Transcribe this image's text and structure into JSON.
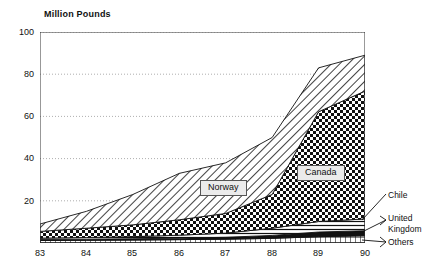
{
  "chart_data": {
    "type": "area",
    "stacked": true,
    "title": "Million Pounds",
    "ylabel": "Million Pounds",
    "xlabel": "",
    "x": [
      "83",
      "84",
      "85",
      "86",
      "87",
      "88",
      "89",
      "90"
    ],
    "categories": [
      "83",
      "84",
      "85",
      "86",
      "87",
      "88",
      "89",
      "90"
    ],
    "ylim": [
      0,
      100
    ],
    "yticks": [
      0,
      20,
      40,
      60,
      80,
      100
    ],
    "ytick_labels": [
      "0",
      "20",
      "40",
      "60",
      "80",
      "100"
    ],
    "grid": "horizontal-dotted",
    "legend_position": "right-outside-and-inline",
    "series": [
      {
        "name": "Others",
        "pattern": "fine-grid",
        "values": [
          1.2,
          1.3,
          1.4,
          1.6,
          1.8,
          2.2,
          3.0,
          3.4
        ]
      },
      {
        "name": "United Kingdom",
        "pattern": "solid-black",
        "values": [
          0.5,
          0.5,
          0.6,
          0.7,
          0.9,
          1.4,
          2.2,
          2.4
        ]
      },
      {
        "name": "Chile",
        "pattern": "horizontal-lines",
        "values": [
          0.6,
          0.8,
          1.0,
          1.4,
          2.0,
          3.4,
          5.0,
          5.6
        ]
      },
      {
        "name": "Canada",
        "pattern": "checkerboard",
        "values": [
          3.2,
          4.4,
          5.6,
          7.3,
          9.3,
          16.0,
          52.0,
          60.6
        ]
      },
      {
        "name": "Norway",
        "pattern": "diagonal-hatch",
        "values": [
          3.5,
          8.0,
          14.4,
          22.0,
          24.0,
          27.0,
          20.8,
          17.0
        ]
      }
    ],
    "totals": [
      9.0,
      15.0,
      23.0,
      33.0,
      38.0,
      50.0,
      83.0,
      89.0
    ],
    "annotations": [
      {
        "text": "Norway",
        "type": "inline-label"
      },
      {
        "text": "Canada",
        "type": "inline-label"
      },
      {
        "text": "Chile",
        "type": "callout-label"
      },
      {
        "text": "United Kingdom",
        "type": "callout-label"
      },
      {
        "text": "Others",
        "type": "callout-label"
      }
    ]
  },
  "labels": {
    "norway": "Norway",
    "canada": "Canada",
    "chile": "Chile",
    "united_kingdom_line1": "United",
    "united_kingdom_line2": "Kingdom",
    "others": "Others"
  },
  "colors": {
    "ink": "#111111",
    "axis": "#333333",
    "grid": "#999999",
    "label_box": "#ebebeb"
  }
}
